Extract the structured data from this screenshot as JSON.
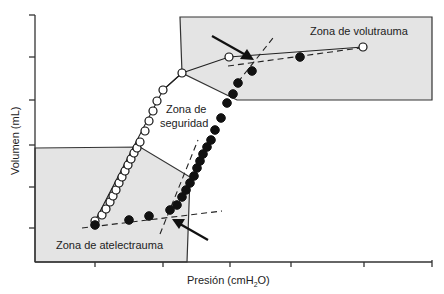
{
  "chart_data": {
    "type": "scatter",
    "title": "",
    "xlabel": "Presión (cmH2O)",
    "xlabel_main": "Presión (cmH",
    "xlabel_sub": "2",
    "xlabel_end": "O)",
    "ylabel": "Volumen (mL)",
    "x_tick_count": 6,
    "y_tick_count": 6,
    "tick_labels_shown": false,
    "grid": false,
    "zones": [
      {
        "name": "Zona de volutrauma",
        "label": "Zona de volutrauma",
        "position": "upper-right",
        "fill": "#e4e4e4"
      },
      {
        "name": "Zona de seguridad",
        "label_line1": "Zona de",
        "label_line2": "seguridad",
        "position": "middle",
        "fill": "#ffffff"
      },
      {
        "name": "Zona de atelectrauma",
        "label": "Zona de atelectrauma",
        "position": "lower-left",
        "fill": "#e4e4e4"
      }
    ],
    "series": [
      {
        "name": "Curva de deflación (círculos abiertos)",
        "marker": "open-circle",
        "points_px": [
          [
            95,
            221
          ],
          [
            102,
            215
          ],
          [
            106,
            209
          ],
          [
            110,
            202
          ],
          [
            113,
            196
          ],
          [
            116,
            190
          ],
          [
            119,
            183
          ],
          [
            122,
            177
          ],
          [
            125,
            171
          ],
          [
            128,
            165
          ],
          [
            131,
            159
          ],
          [
            134,
            153
          ],
          [
            137,
            148
          ],
          [
            140,
            142
          ],
          [
            145,
            131
          ],
          [
            149,
            121
          ],
          [
            153,
            111
          ],
          [
            157,
            101
          ],
          [
            163,
            90
          ],
          [
            182,
            73
          ],
          [
            229,
            57
          ],
          [
            363,
            47
          ]
        ]
      },
      {
        "name": "Curva de inflación (círculos cerrados)",
        "marker": "filled-circle",
        "points_px": [
          [
            95,
            225
          ],
          [
            129,
            220
          ],
          [
            149,
            216
          ],
          [
            170,
            210
          ],
          [
            177,
            205
          ],
          [
            182,
            197
          ],
          [
            186,
            190
          ],
          [
            190,
            183
          ],
          [
            194,
            176
          ],
          [
            197,
            168
          ],
          [
            200,
            161
          ],
          [
            203,
            154
          ],
          [
            207,
            147
          ],
          [
            211,
            140
          ],
          [
            215,
            130
          ],
          [
            221,
            118
          ],
          [
            227,
            103
          ],
          [
            233,
            94
          ],
          [
            238,
            83
          ],
          [
            252,
            71
          ],
          [
            300,
            57
          ]
        ]
      }
    ],
    "annotations": [
      {
        "type": "arrow",
        "label": "Punto de inflexión inferior",
        "target_px": [
          170,
          218
        ]
      },
      {
        "type": "arrow",
        "label": "Punto de inflexión superior",
        "target_px": [
          256,
          60
        ]
      }
    ]
  },
  "labels": {
    "zone_volutrauma": "Zona de volutrauma",
    "zone_seguridad_1": "Zona de",
    "zone_seguridad_2": "seguridad",
    "zone_atelectrauma": "Zona de atelectrauma",
    "y_axis": "Volumen (mL)",
    "x_axis_main": "Presión (cmH",
    "x_axis_sub": "2",
    "x_axis_end": "O)"
  }
}
